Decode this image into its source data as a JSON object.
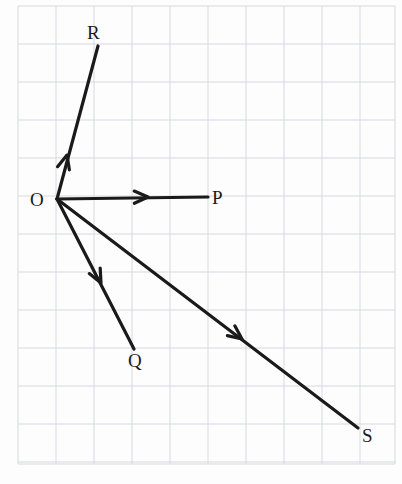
{
  "figure": {
    "type": "vector-diagram",
    "title": "",
    "background_color": "#fdfdfd",
    "grid": {
      "visible": true,
      "color": "#d7d9e0",
      "line_width": 1,
      "cell_width": 38,
      "cell_height": 38,
      "x_start": 18,
      "x_end": 395,
      "y_start": 6,
      "y_end": 464,
      "columns": 10,
      "rows": 12
    },
    "stroke_color": "#1a1a1a",
    "stroke_width": 3.2,
    "origin": {
      "name": "O",
      "label": "O",
      "x": 57,
      "y": 199,
      "label_x": 30,
      "label_y": 206
    },
    "vectors": [
      {
        "name": "OP",
        "label": "P",
        "from_x": 57,
        "from_y": 199,
        "to_x": 208,
        "to_y": 197,
        "arrow_x": 148,
        "arrow_y": 197,
        "label_x": 212,
        "label_y": 204,
        "direction": "east",
        "grid_components": {
          "dx": 4,
          "dy": 0
        }
      },
      {
        "name": "OR",
        "label": "R",
        "from_x": 57,
        "from_y": 199,
        "to_x": 98,
        "to_y": 46,
        "arrow_x": 67,
        "arrow_y": 155,
        "label_x": 87,
        "label_y": 39,
        "direction": "north-north-east",
        "grid_components": {
          "dx": 1,
          "dy": 4
        }
      },
      {
        "name": "OQ",
        "label": "Q",
        "from_x": 57,
        "from_y": 199,
        "to_x": 134,
        "to_y": 349,
        "arrow_x": 101,
        "arrow_y": 283,
        "label_x": 128,
        "label_y": 367,
        "direction": "south-south-east",
        "grid_components": {
          "dx": 2,
          "dy": -4
        }
      },
      {
        "name": "OS",
        "label": "S",
        "from_x": 57,
        "from_y": 199,
        "to_x": 358,
        "to_y": 428,
        "arrow_x": 242,
        "arrow_y": 339,
        "label_x": 362,
        "label_y": 442,
        "direction": "east-south-east",
        "grid_components": {
          "dx": 8,
          "dy": -6
        }
      }
    ],
    "labels": [
      "O",
      "P",
      "Q",
      "R",
      "S"
    ]
  }
}
